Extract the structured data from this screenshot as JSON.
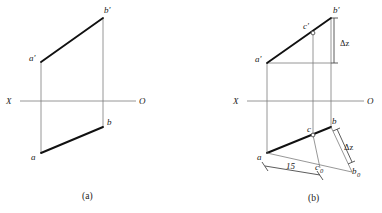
{
  "figure": {
    "background_color": "#ffffff",
    "line_color_thin": "#7c7c7c",
    "line_color_thick": "#111111",
    "text_color": "#1a1a1a"
  },
  "panel_a": {
    "caption": "(a)",
    "axis": {
      "left_label": "X",
      "right_label": "O"
    },
    "labels": {
      "a_prime": "a'",
      "b_prime": "b'",
      "a": "a",
      "b": "b"
    }
  },
  "panel_b": {
    "caption": "(b)",
    "axis": {
      "left_label": "X",
      "right_label": "O"
    },
    "labels": {
      "a_prime": "a'",
      "b_prime": "b'",
      "c_prime": "c'",
      "a": "a",
      "b": "b",
      "c": "c",
      "c_zero": "c",
      "c_zero_sub": "0",
      "b_zero": "b",
      "b_zero_sub": "0"
    },
    "annotations": {
      "delta_z_upper": "Δz",
      "delta_z_lower": "Δz",
      "dimension_15": "15"
    }
  }
}
